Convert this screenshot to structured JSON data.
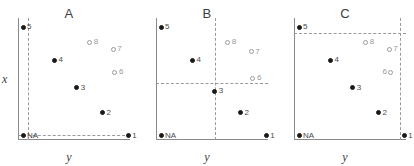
{
  "chart_data": {
    "type": "scatter",
    "title": "",
    "xlabel": "y",
    "ylabel": "x",
    "xlim": [
      0,
      1
    ],
    "ylim": [
      0,
      1
    ],
    "grid": false,
    "legend": "none",
    "panels": [
      {
        "title": "A",
        "xlabel": "y",
        "ylabel": "x",
        "show_ylabel": true,
        "guide_v": 0.085,
        "guide_h": 0.045,
        "points": [
          {
            "label": "NA",
            "x": 0.045,
            "y": 0.035,
            "style": "filled",
            "label_side": "right"
          },
          {
            "label": "1",
            "x": 0.985,
            "y": 0.035,
            "style": "filled",
            "label_side": "right"
          },
          {
            "label": "2",
            "x": 0.755,
            "y": 0.225,
            "style": "filled",
            "label_side": "right"
          },
          {
            "label": "3",
            "x": 0.525,
            "y": 0.43,
            "style": "filled",
            "label_side": "right"
          },
          {
            "label": "4",
            "x": 0.325,
            "y": 0.655,
            "style": "filled",
            "label_side": "right"
          },
          {
            "label": "5",
            "x": 0.045,
            "y": 0.925,
            "style": "filled",
            "label_side": "right"
          },
          {
            "label": "6",
            "x": 0.865,
            "y": 0.555,
            "style": "open",
            "label_side": "right"
          },
          {
            "label": "7",
            "x": 0.85,
            "y": 0.745,
            "style": "open",
            "label_side": "right"
          },
          {
            "label": "8",
            "x": 0.64,
            "y": 0.8,
            "style": "open",
            "label_side": "right"
          }
        ]
      },
      {
        "title": "B",
        "xlabel": "y",
        "ylabel": "x",
        "show_ylabel": false,
        "guide_v": 0.525,
        "guide_h": 0.47,
        "points": [
          {
            "label": "NA",
            "x": 0.045,
            "y": 0.035,
            "style": "filled",
            "label_side": "right"
          },
          {
            "label": "1",
            "x": 0.985,
            "y": 0.035,
            "style": "filled",
            "label_side": "right"
          },
          {
            "label": "2",
            "x": 0.755,
            "y": 0.225,
            "style": "filled",
            "label_side": "right"
          },
          {
            "label": "3",
            "x": 0.525,
            "y": 0.4,
            "style": "filled",
            "label_side": "right"
          },
          {
            "label": "4",
            "x": 0.325,
            "y": 0.655,
            "style": "filled",
            "label_side": "right"
          },
          {
            "label": "5",
            "x": 0.045,
            "y": 0.925,
            "style": "filled",
            "label_side": "right"
          },
          {
            "label": "6",
            "x": 0.865,
            "y": 0.505,
            "style": "open",
            "label_side": "right"
          },
          {
            "label": "7",
            "x": 0.85,
            "y": 0.725,
            "style": "open",
            "label_side": "right"
          },
          {
            "label": "8",
            "x": 0.64,
            "y": 0.8,
            "style": "open",
            "label_side": "right"
          }
        ]
      },
      {
        "title": "C",
        "xlabel": "y",
        "ylabel": "x",
        "show_ylabel": false,
        "guide_v": 0.945,
        "guide_h": 0.88,
        "points": [
          {
            "label": "NA",
            "x": 0.045,
            "y": 0.035,
            "style": "filled",
            "label_side": "right"
          },
          {
            "label": "1",
            "x": 0.985,
            "y": 0.035,
            "style": "filled",
            "label_side": "right"
          },
          {
            "label": "2",
            "x": 0.755,
            "y": 0.225,
            "style": "filled",
            "label_side": "right"
          },
          {
            "label": "3",
            "x": 0.525,
            "y": 0.43,
            "style": "filled",
            "label_side": "right"
          },
          {
            "label": "4",
            "x": 0.325,
            "y": 0.655,
            "style": "filled",
            "label_side": "right"
          },
          {
            "label": "5",
            "x": 0.045,
            "y": 0.925,
            "style": "filled",
            "label_side": "right"
          },
          {
            "label": "6",
            "x": 0.865,
            "y": 0.555,
            "style": "open",
            "label_side": "left"
          },
          {
            "label": "7",
            "x": 0.85,
            "y": 0.745,
            "style": "open",
            "label_side": "right"
          },
          {
            "label": "8",
            "x": 0.64,
            "y": 0.8,
            "style": "open",
            "label_side": "right"
          }
        ]
      }
    ]
  }
}
